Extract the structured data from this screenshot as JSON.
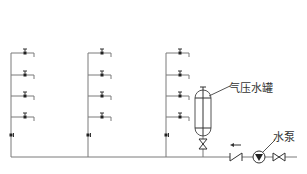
{
  "diagram": {
    "type": "water-supply-schematic",
    "colors": {
      "pipe": "#7a7a7a",
      "symbol": "#333333",
      "background": "#ffffff"
    },
    "main_pipe": {
      "y": 157,
      "x_start": 11,
      "x_end": 297
    },
    "risers": [
      {
        "x": 11,
        "top": 53,
        "branches": [
          53,
          75,
          96,
          117
        ],
        "riser_valve_y": 135
      },
      {
        "x": 88,
        "top": 53,
        "branches": [
          53,
          75,
          96,
          117
        ],
        "riser_valve_y": 135
      },
      {
        "x": 166,
        "top": 53,
        "branches": [
          53,
          75,
          96,
          117
        ],
        "riser_valve_y": 135
      }
    ],
    "components": {
      "pressure_tank": {
        "label": "气压水罐",
        "cx": 203,
        "top": 90,
        "bottom": 136
      },
      "pump": {
        "label": "水泵",
        "cx": 259,
        "cy": 157
      },
      "check_valve": {
        "cx": 236
      },
      "gate_valve": {
        "cx": 279
      },
      "flow_arrow": {
        "direction": "left"
      }
    }
  }
}
